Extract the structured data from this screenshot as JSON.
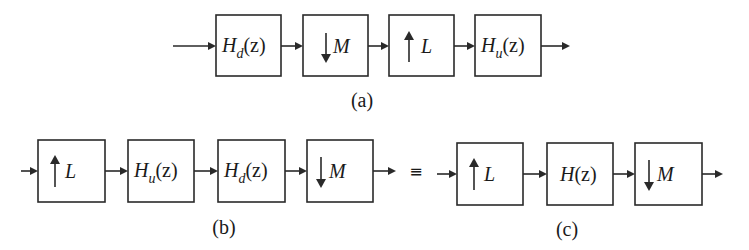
{
  "diagram": {
    "type": "multirate-signal-flow",
    "row_a": {
      "caption": "(a)",
      "blocks": [
        {
          "id": "Hd",
          "kind": "filter",
          "label": "H",
          "subscript": "d",
          "arg": "(z)"
        },
        {
          "id": "downM",
          "kind": "downsampler",
          "arrow": "↓",
          "label": "M"
        },
        {
          "id": "upL",
          "kind": "upsampler",
          "arrow": "↑",
          "label": "L"
        },
        {
          "id": "Hu",
          "kind": "filter",
          "label": "H",
          "subscript": "u",
          "arg": "(z)"
        }
      ]
    },
    "row_b": {
      "caption": "(b)",
      "blocks": [
        {
          "id": "upL",
          "kind": "upsampler",
          "arrow": "↑",
          "label": "L"
        },
        {
          "id": "Hu",
          "kind": "filter",
          "label": "H",
          "subscript": "u",
          "arg": "(z)"
        },
        {
          "id": "Hd",
          "kind": "filter",
          "label": "H",
          "subscript": "d",
          "arg": "(z)"
        },
        {
          "id": "downM",
          "kind": "downsampler",
          "arrow": "↓",
          "label": "M"
        }
      ]
    },
    "equivalence_symbol": "≡",
    "row_c": {
      "caption": "(c)",
      "blocks": [
        {
          "id": "upL",
          "kind": "upsampler",
          "arrow": "↑",
          "label": "L"
        },
        {
          "id": "H",
          "kind": "filter",
          "label": "H",
          "subscript": "",
          "arg": "(z)"
        },
        {
          "id": "downM",
          "kind": "downsampler",
          "arrow": "↓",
          "label": "M"
        }
      ]
    }
  }
}
